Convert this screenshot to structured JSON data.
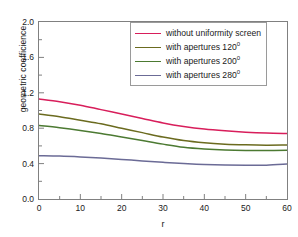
{
  "chart_data": {
    "type": "line",
    "title": "",
    "xlabel": "r",
    "ylabel": "geometric coefficience",
    "xlim": [
      0,
      60
    ],
    "ylim": [
      0.0,
      2.0
    ],
    "xticks": [
      0,
      10,
      20,
      30,
      40,
      50,
      60
    ],
    "xtick_labels": [
      "0",
      "10",
      "20",
      "30",
      "40",
      "50",
      "60"
    ],
    "xminor_ticks": [
      5,
      15,
      25,
      35,
      45,
      55
    ],
    "yticks": [
      0.0,
      0.4,
      0.8,
      1.2,
      1.6,
      2.0
    ],
    "ytick_labels": [
      "0.0",
      "0.4",
      "0.8",
      "1.2",
      "1.6",
      "2.0"
    ],
    "yminor_ticks": [
      0.2,
      0.6,
      1.0,
      1.4,
      1.8
    ],
    "grid": false,
    "legend_position": "top-right",
    "x": [
      0,
      5,
      10,
      15,
      20,
      25,
      30,
      35,
      40,
      45,
      50,
      55,
      60
    ],
    "series": [
      {
        "name": "without uniformity screen",
        "color": "#D81E5B",
        "values": [
          1.13,
          1.1,
          1.06,
          1.01,
          0.96,
          0.91,
          0.86,
          0.82,
          0.79,
          0.77,
          0.755,
          0.745,
          0.74
        ]
      },
      {
        "name": "with apertures 120°",
        "color": "#6B6B1F",
        "values": [
          0.96,
          0.93,
          0.89,
          0.85,
          0.8,
          0.75,
          0.7,
          0.66,
          0.635,
          0.62,
          0.612,
          0.608,
          0.61
        ]
      },
      {
        "name": "with apertures 200°",
        "color": "#4C7A32",
        "values": [
          0.83,
          0.805,
          0.775,
          0.74,
          0.7,
          0.66,
          0.62,
          0.585,
          0.565,
          0.553,
          0.548,
          0.548,
          0.552
        ]
      },
      {
        "name": "with apertures 280°",
        "color": "#6B6B96",
        "values": [
          0.49,
          0.485,
          0.475,
          0.462,
          0.447,
          0.43,
          0.414,
          0.4,
          0.39,
          0.384,
          0.381,
          0.382,
          0.395
        ]
      }
    ]
  },
  "legend": {
    "entries": [
      {
        "label": "without uniformity screen",
        "sup": "",
        "color": "#D81E5B"
      },
      {
        "label": "with apertures 120",
        "sup": "0",
        "color": "#6B6B1F"
      },
      {
        "label": "with apertures 200",
        "sup": "0",
        "color": "#4C7A32"
      },
      {
        "label": "with apertures 280",
        "sup": "0",
        "color": "#6B6B96"
      }
    ]
  }
}
